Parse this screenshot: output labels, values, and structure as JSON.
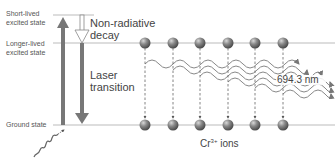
{
  "levels": {
    "short_lived": "Short-lived excited state",
    "short_lived_l1": "Short-lived",
    "short_lived_l2": "excited state",
    "longer_lived_l1": "Longer-lived",
    "longer_lived_l2": "excited state",
    "ground": "Ground state"
  },
  "processes": {
    "nonradiative_l1": "Non-radiative",
    "nonradiative_l2": "decay",
    "laser_l1": "Laser",
    "laser_l2": "transition"
  },
  "wavelength_label": "694.3 nm",
  "ions_label_base": "Cr",
  "ions_label_sup": "3+",
  "ions_label_rest": " ions",
  "atom_count_per_row": 6,
  "colors": {
    "arrow": "#777777",
    "line": "#bbbbbb",
    "atom": "#6a6a6a",
    "text": "#555555"
  }
}
